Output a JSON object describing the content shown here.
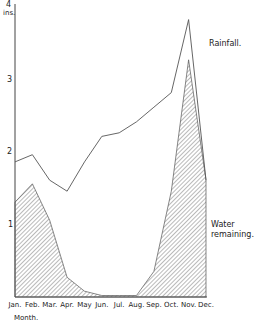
{
  "chart_data": {
    "type": "area",
    "title": "",
    "xlabel": "Month.",
    "ylabel": "ins.",
    "ylim": [
      0,
      4
    ],
    "yticks": [
      1,
      2,
      3,
      4
    ],
    "grid": false,
    "categories": [
      "Jan.",
      "Feb.",
      "Mar.",
      "Apr.",
      "May",
      "Jun.",
      "Jul.",
      "Aug.",
      "Sep.",
      "Oct.",
      "Nov.",
      "Dec."
    ],
    "series": [
      {
        "name": "Rainfall.",
        "style": "line",
        "values": [
          1.85,
          1.95,
          1.6,
          1.45,
          1.85,
          2.2,
          2.25,
          2.4,
          2.6,
          2.8,
          3.8,
          1.6
        ]
      },
      {
        "name": "Water remaining.",
        "style": "hatched-area",
        "values": [
          1.3,
          1.55,
          1.05,
          0.27,
          0.08,
          0.02,
          0.02,
          0.02,
          0.35,
          1.45,
          3.25,
          1.6
        ]
      }
    ],
    "annotations": [
      {
        "text": "Rainfall.",
        "near": "Nov-Dec upper right"
      },
      {
        "text": "Water remaining.",
        "near": "Dec lower right"
      }
    ],
    "colors": {
      "line": "#555555",
      "hatch": "#666666",
      "text": "#222222"
    }
  },
  "labels": {
    "y_unit": "ins.",
    "x_title": "Month.",
    "rainfall": "Rainfall.",
    "water_line1": "Water",
    "water_line2": "remaining.",
    "y4": "4",
    "y3": "3",
    "y2": "2",
    "y1": "1"
  }
}
